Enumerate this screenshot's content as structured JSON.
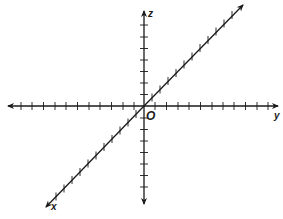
{
  "diagram": {
    "type": "3d-coordinate-axes",
    "origin_label": "O",
    "axes": [
      {
        "name": "x",
        "label": "x",
        "direction": "diagonal toward lower-left"
      },
      {
        "name": "y",
        "label": "y",
        "direction": "horizontal toward right"
      },
      {
        "name": "z",
        "label": "z",
        "direction": "vertical upward"
      }
    ],
    "colors": {
      "line": "#1a1a1a",
      "background": "#ffffff"
    }
  }
}
